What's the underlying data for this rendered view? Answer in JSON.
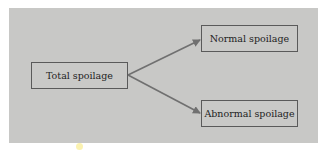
{
  "diagram": {
    "root": {
      "label": "Total spoilage"
    },
    "branches": [
      {
        "label": "Normal spoilage"
      },
      {
        "label": "Abnormal spoilage"
      }
    ],
    "colors": {
      "panel_background": "#c8c8c6",
      "box_border": "#5a5a5a",
      "arrow": "#707070",
      "text": "#1e1e1e"
    }
  }
}
